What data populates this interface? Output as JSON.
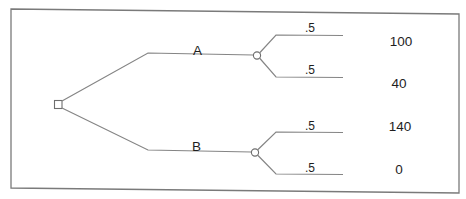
{
  "diagram": {
    "type": "decision-tree",
    "colors": {
      "line": "#858585",
      "frame": "#7a7a7a",
      "text": "#1e1e1e",
      "background": "#ffffff"
    },
    "decision_node": {
      "shape": "square",
      "label": ""
    },
    "alternatives": [
      {
        "label": "A",
        "chance_node": {
          "shape": "circle"
        },
        "outcomes": [
          {
            "probability": ".5",
            "payoff": "100"
          },
          {
            "probability": ".5",
            "payoff": "40"
          }
        ]
      },
      {
        "label": "B",
        "chance_node": {
          "shape": "circle"
        },
        "outcomes": [
          {
            "probability": ".5",
            "payoff": "140"
          },
          {
            "probability": ".5",
            "payoff": "0"
          }
        ]
      }
    ]
  }
}
